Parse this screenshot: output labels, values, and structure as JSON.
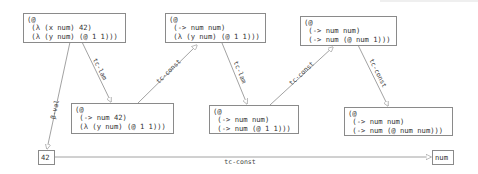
{
  "diagram": {
    "nodes": [
      {
        "id": "n1",
        "lines": [
          "(@",
          " (λ (x num) 42)",
          " (λ (y num) (@ 1 1)))"
        ]
      },
      {
        "id": "n2",
        "lines": [
          "(@",
          " (-> num num)",
          " (λ (y num) (@ 1 1)))"
        ]
      },
      {
        "id": "n3",
        "lines": [
          "(@",
          " (-> num num)",
          " (-> num (@ num 1)))"
        ]
      },
      {
        "id": "n4",
        "lines": [
          "(@",
          " (-> num 42)",
          " (λ (y num) (@ 1 1)))"
        ]
      },
      {
        "id": "n5",
        "lines": [
          "(@",
          " (-> num num)",
          " (-> num (@ 1 1)))"
        ]
      },
      {
        "id": "n6",
        "lines": [
          "(@",
          " (-> num num)",
          " (-> num (@ num num)))"
        ]
      },
      {
        "id": "n7",
        "lines": [
          "42"
        ]
      },
      {
        "id": "n8",
        "lines": [
          "num"
        ]
      }
    ],
    "edges": [
      {
        "from": "n1",
        "to": "n7",
        "label": "β-val"
      },
      {
        "from": "n1",
        "to": "n4",
        "label": "tc-lam"
      },
      {
        "from": "n4",
        "to": "n2",
        "label": "tc-const"
      },
      {
        "from": "n2",
        "to": "n5",
        "label": "tc-lam"
      },
      {
        "from": "n5",
        "to": "n3",
        "label": "tc-const"
      },
      {
        "from": "n3",
        "to": "n6",
        "label": "tc-const"
      },
      {
        "from": "n7",
        "to": "n8",
        "label": "tc-const"
      }
    ],
    "text": {
      "n1": "(@\n (λ (x num) 42)\n (λ (y num) (@ 1 1)))",
      "n2": "(@\n (-> num num)\n (λ (y num) (@ 1 1)))",
      "n3": "(@\n (-> num num)\n (-> num (@ num 1)))",
      "n4": "(@\n (-> num 42)\n (λ (y num) (@ 1 1)))",
      "n5": "(@\n (-> num num)\n (-> num (@ 1 1)))",
      "n6": "(@\n (-> num num)\n (-> num (@ num num)))",
      "n7": "42",
      "n8": "num"
    },
    "edge_labels": {
      "e1": "β-val",
      "e2": "tc-lam",
      "e3": "tc-const",
      "e4": "tc-lam",
      "e5": "tc-const",
      "e6": "tc-const",
      "e7": "tc-const"
    },
    "colors": {
      "edge": "#8a8a8a",
      "border": "#8a8a8a",
      "text": "#333333"
    }
  }
}
